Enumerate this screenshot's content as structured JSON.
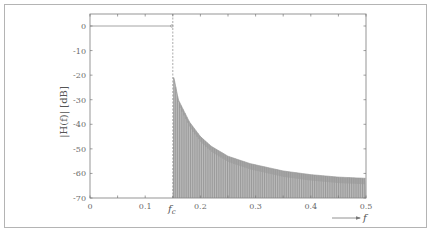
{
  "chart_data": {
    "type": "line",
    "title": "",
    "xlabel": "f",
    "ylabel": "|H(f)| [dB]",
    "xlim": [
      0,
      0.5
    ],
    "ylim": [
      -70,
      5
    ],
    "x_ticks": [
      0,
      0.1,
      0.15,
      0.2,
      0.3,
      0.4,
      0.5
    ],
    "x_tick_labels": [
      "0",
      "0.1",
      "f_c",
      "0.2",
      "0.3",
      "0.4",
      "0.5"
    ],
    "y_ticks": [
      0,
      -10,
      -20,
      -30,
      -40,
      -50,
      -60,
      -70
    ],
    "y_tick_labels": [
      "0",
      "-10",
      "-20",
      "-30",
      "-40",
      "-50",
      "-60",
      "-70"
    ],
    "grid": false,
    "legend": null,
    "annotations": [
      {
        "text": "f_c",
        "x": 0.15,
        "note": "cutoff frequency, dashed vertical line"
      }
    ],
    "series": [
      {
        "name": "passband",
        "x": [
          0,
          0.15
        ],
        "values": [
          0,
          0
        ]
      },
      {
        "name": "stopband sidelobe envelope",
        "x": [
          0.152,
          0.16,
          0.18,
          0.2,
          0.22,
          0.25,
          0.29,
          0.3,
          0.35,
          0.4,
          0.45,
          0.5
        ],
        "values": [
          -21,
          -30,
          -39,
          -45,
          -49,
          -53,
          -56,
          -56.5,
          -59,
          -60.5,
          -61.5,
          -62
        ]
      }
    ],
    "stopband_floor": -70,
    "cutoff_frequency": 0.15
  },
  "labels": {
    "ylabel_text": "|H(f)| [dB]",
    "xlabel_text": "f",
    "fc_main": "f",
    "fc_sub": "c"
  }
}
